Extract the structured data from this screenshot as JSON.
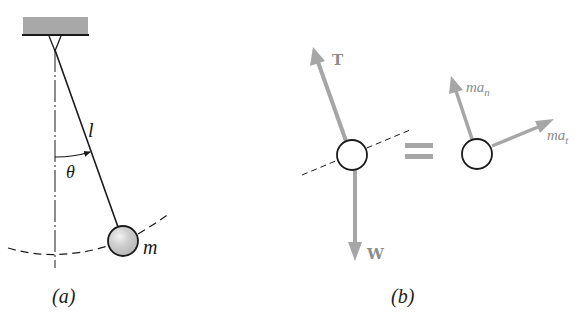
{
  "figure": {
    "panel_a": {
      "caption": "(a)",
      "labels": {
        "length": "l",
        "angle": "θ",
        "mass": "m"
      }
    },
    "panel_b": {
      "caption": "(b)",
      "equals": "=",
      "forces": {
        "tension": "T",
        "weight": "W"
      },
      "inertia": {
        "normal_base": "ma",
        "normal_sub": "n",
        "tangential_base": "ma",
        "tangential_sub": "t"
      }
    }
  },
  "colors": {
    "line": "#1a1a1a",
    "vector": "#a6a6a6",
    "ceiling": "#a8a8a8",
    "bob": "#c8c8c8",
    "label_gray": "#8c8c8c"
  }
}
